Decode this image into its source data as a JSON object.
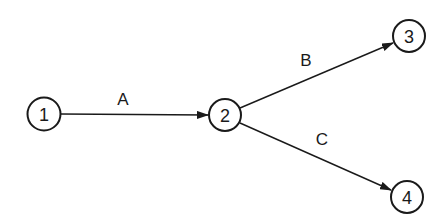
{
  "diagram": {
    "type": "activity-on-arrow network",
    "nodes": [
      {
        "id": "1",
        "label": "1",
        "cx": 44,
        "cy": 114,
        "r": 16
      },
      {
        "id": "2",
        "label": "2",
        "cx": 225,
        "cy": 115,
        "r": 16
      },
      {
        "id": "3",
        "label": "3",
        "cx": 409,
        "cy": 36,
        "r": 16
      },
      {
        "id": "4",
        "label": "4",
        "cx": 407,
        "cy": 197,
        "r": 16
      }
    ],
    "edges": [
      {
        "from": "1",
        "to": "2",
        "label": "A",
        "label_x": 123,
        "label_y": 99
      },
      {
        "from": "2",
        "to": "3",
        "label": "B",
        "label_x": 306,
        "label_y": 60
      },
      {
        "from": "2",
        "to": "4",
        "label": "C",
        "label_x": 322,
        "label_y": 139
      }
    ],
    "colors": {
      "stroke": "#1a1a1a",
      "background": "#ffffff"
    }
  }
}
